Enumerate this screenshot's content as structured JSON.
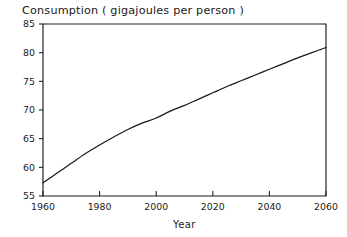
{
  "chart_data": {
    "type": "line",
    "title": "Consumption  ( gigajoules per person )",
    "xlabel": "Year",
    "ylabel": "",
    "xlim": [
      1960,
      2060
    ],
    "ylim": [
      55,
      85
    ],
    "grid": false,
    "legend": false,
    "x_ticks": [
      1960,
      1980,
      2000,
      2020,
      2040,
      2060
    ],
    "y_ticks": [
      55,
      60,
      65,
      70,
      75,
      80,
      85
    ],
    "x_tick_labels": [
      "1960",
      "1980",
      "2000",
      "2020",
      "2040",
      "2060"
    ],
    "y_tick_labels": [
      "55",
      "60",
      "65",
      "70",
      "75",
      "80",
      "85"
    ],
    "line_color": "#1a1a1a",
    "series": [
      {
        "name": "Consumption",
        "x": [
          1960,
          1965,
          1970,
          1975,
          1980,
          1985,
          1990,
          1995,
          2000,
          2005,
          2010,
          2015,
          2020,
          2025,
          2030,
          2035,
          2040,
          2045,
          2050,
          2055,
          2060
        ],
        "values": [
          57.3,
          59.0,
          60.7,
          62.4,
          63.9,
          65.3,
          66.6,
          67.7,
          68.6,
          69.8,
          70.8,
          71.9,
          73.0,
          74.1,
          75.1,
          76.1,
          77.1,
          78.1,
          79.1,
          80.0,
          80.9
        ]
      }
    ]
  },
  "axis_titles": {
    "x": "Year"
  },
  "title": {
    "main": "Consumption",
    "unit": "( gigajoules per person )",
    "full": "Consumption  ( gigajoules per person )"
  }
}
